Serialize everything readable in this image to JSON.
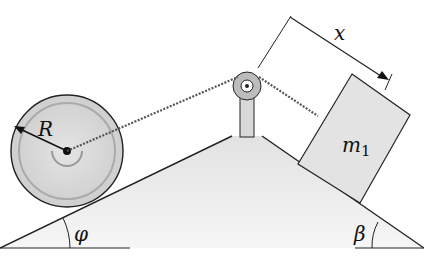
{
  "diagram": {
    "type": "physics-inclined-planes",
    "labels": {
      "radius": "R",
      "distance": "x",
      "mass": "m",
      "mass_subscript": "1",
      "left_angle": "φ",
      "right_angle": "β"
    },
    "colors": {
      "wedge_fill": "#eeeeee",
      "wheel_fill": "#d6d6d6",
      "block_fill": "#e3e3e3",
      "line": "#222222"
    }
  }
}
